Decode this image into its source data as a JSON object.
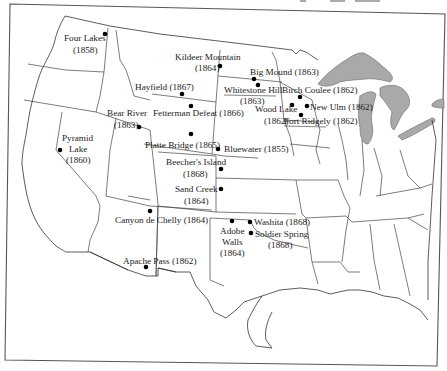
{
  "map": {
    "subject": "Battle sites in the western United States",
    "lake_color": "#a9a9a9",
    "marker_color": "#000000",
    "sites": [
      {
        "id": "four-lakes",
        "name": "Four Lakes",
        "year": "(1858)"
      },
      {
        "id": "kildeer-mountain",
        "name": "Kildeer Mountain",
        "year": "(1864)"
      },
      {
        "id": "hayfield",
        "name": "Hayfield (1867)"
      },
      {
        "id": "fetterman-defeat",
        "name": "Fetterman Defeat (1866)"
      },
      {
        "id": "bear-river",
        "name": "Bear River",
        "year": "(1863)"
      },
      {
        "id": "pyramid-lake",
        "name": "Pyramid",
        "name2": "Lake",
        "year": "(1860)"
      },
      {
        "id": "platte-bridge",
        "name": "Platte Bridge (1865)"
      },
      {
        "id": "bluewater",
        "name": "Bluewater (1855)"
      },
      {
        "id": "big-mound",
        "name": "Big Mound (1863)"
      },
      {
        "id": "whitestone-hill",
        "name": "Whitestone Hill",
        "year": "(1863)"
      },
      {
        "id": "birch-coulee",
        "name": "Birch Coulee (1862)"
      },
      {
        "id": "new-ulm",
        "name": "New Ulm (1862)"
      },
      {
        "id": "wood-lake",
        "name": "Wood Lake",
        "year": "(1862)"
      },
      {
        "id": "fort-ridgely",
        "name": "Fort Ridgely (1862)"
      },
      {
        "id": "beechers-island",
        "name": "Beecher's Island",
        "year": "(1868)"
      },
      {
        "id": "sand-creek",
        "name": "Sand Creek",
        "year": "(1864)"
      },
      {
        "id": "canyon-de-chelly",
        "name": "Canyon de Chelly (1864)"
      },
      {
        "id": "apache-pass",
        "name": "Apache Pass (1862)"
      },
      {
        "id": "adobe-walls",
        "name": "Adobe",
        "name2": "Walls",
        "year": "(1864)"
      },
      {
        "id": "washita",
        "name": "Washita (1868)"
      },
      {
        "id": "soldier-spring",
        "name": "Soldier Spring",
        "year": "(1868)"
      }
    ]
  }
}
